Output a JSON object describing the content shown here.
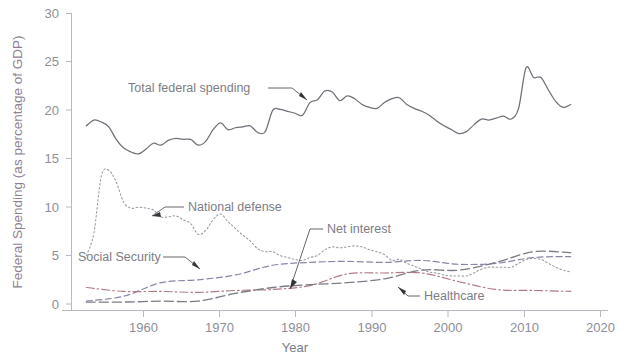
{
  "chart_data": {
    "type": "line",
    "title": "",
    "xlabel": "Year",
    "ylabel": "Federal Spending (as percentage of GDP)",
    "xlim": [
      1948,
      2020
    ],
    "ylim": [
      0,
      30
    ],
    "xticks": [
      1960,
      1970,
      1980,
      1990,
      2000,
      2010,
      2020
    ],
    "yticks": [
      0,
      5,
      10,
      15,
      20,
      25,
      30
    ],
    "grid": false,
    "legend": "inline-annotations",
    "series": [
      {
        "name": "Total federal spending",
        "color": "#6f6f77",
        "style": "solid",
        "x": [
          1950,
          1951,
          1952,
          1953,
          1954,
          1955,
          1956,
          1957,
          1958,
          1959,
          1960,
          1961,
          1962,
          1963,
          1964,
          1965,
          1966,
          1967,
          1968,
          1969,
          1970,
          1971,
          1972,
          1973,
          1974,
          1975,
          1976,
          1977,
          1978,
          1979,
          1980,
          1981,
          1982,
          1983,
          1984,
          1985,
          1986,
          1987,
          1988,
          1989,
          1990,
          1991,
          1992,
          1993,
          1994,
          1995,
          1996,
          1997,
          1998,
          1999,
          2000,
          2001,
          2002,
          2003,
          2004,
          2005,
          2006,
          2007,
          2008,
          2009,
          2010,
          2011,
          2012,
          2013,
          2014,
          2015
        ],
        "values": [
          18.4,
          19.0,
          18.8,
          18.3,
          17.0,
          16.1,
          15.7,
          15.5,
          16.0,
          16.6,
          16.4,
          16.9,
          17.1,
          17.0,
          17.0,
          16.4,
          16.8,
          18.0,
          18.7,
          18.0,
          18.2,
          18.3,
          18.4,
          17.7,
          17.8,
          20.0,
          20.1,
          19.9,
          19.7,
          19.5,
          20.8,
          21.1,
          22.0,
          21.9,
          21.0,
          21.5,
          21.2,
          20.6,
          20.3,
          20.2,
          20.8,
          21.2,
          21.3,
          20.6,
          20.2,
          19.9,
          19.5,
          18.9,
          18.4,
          18.0,
          17.6,
          17.8,
          18.5,
          19.1,
          19.0,
          19.2,
          19.4,
          19.1,
          20.2,
          24.4,
          23.4,
          23.4,
          22.1,
          20.9,
          20.3,
          20.6
        ]
      },
      {
        "name": "National defense",
        "color": "#9b9ba5",
        "style": "dotted",
        "x": [
          1950,
          1951,
          1952,
          1953,
          1954,
          1955,
          1956,
          1957,
          1958,
          1959,
          1960,
          1961,
          1962,
          1963,
          1964,
          1965,
          1966,
          1967,
          1968,
          1969,
          1970,
          1971,
          1972,
          1973,
          1974,
          1975,
          1976,
          1977,
          1978,
          1979,
          1980,
          1981,
          1982,
          1983,
          1984,
          1985,
          1986,
          1987,
          1988,
          1989,
          1990,
          1991,
          1992,
          1993,
          1994,
          1995,
          1996,
          1997,
          1998,
          1999,
          2000,
          2001,
          2002,
          2003,
          2004,
          2005,
          2006,
          2007,
          2008,
          2009,
          2010,
          2011,
          2012,
          2013,
          2014,
          2015
        ],
        "values": [
          5.0,
          7.3,
          13.2,
          13.8,
          12.6,
          10.5,
          9.9,
          10.0,
          9.9,
          9.7,
          9.0,
          9.0,
          9.1,
          8.7,
          8.3,
          7.2,
          7.6,
          8.7,
          9.3,
          8.5,
          7.8,
          7.1,
          6.5,
          5.7,
          5.4,
          5.4,
          5.0,
          4.8,
          4.6,
          4.5,
          4.8,
          5.0,
          5.6,
          5.9,
          5.8,
          5.9,
          6.0,
          5.9,
          5.6,
          5.4,
          5.1,
          4.5,
          4.6,
          4.2,
          3.9,
          3.6,
          3.3,
          3.2,
          3.0,
          2.9,
          2.9,
          2.9,
          3.2,
          3.6,
          3.8,
          3.8,
          3.8,
          3.8,
          4.2,
          4.6,
          4.7,
          4.6,
          4.2,
          3.8,
          3.5,
          3.3
        ]
      },
      {
        "name": "Social Security",
        "color": "#8686a8",
        "style": "dashed",
        "x": [
          1950,
          1955,
          1960,
          1965,
          1970,
          1975,
          1980,
          1985,
          1990,
          1995,
          2000,
          2005,
          2010,
          2015
        ],
        "values": [
          0.3,
          0.8,
          2.2,
          2.5,
          3.0,
          4.0,
          4.3,
          4.4,
          4.3,
          4.5,
          4.1,
          4.2,
          4.8,
          4.9
        ]
      },
      {
        "name": "Net interest",
        "color": "#b07a86",
        "style": "dashdot",
        "x": [
          1950,
          1955,
          1960,
          1965,
          1970,
          1975,
          1980,
          1985,
          1990,
          1995,
          2000,
          2005,
          2010,
          2015
        ],
        "values": [
          1.7,
          1.3,
          1.3,
          1.2,
          1.4,
          1.5,
          1.9,
          3.1,
          3.2,
          3.2,
          2.3,
          1.5,
          1.4,
          1.3
        ]
      },
      {
        "name": "Healthcare",
        "color": "#7c7c86",
        "style": "longdash",
        "x": [
          1950,
          1955,
          1960,
          1965,
          1970,
          1975,
          1980,
          1985,
          1990,
          1995,
          2000,
          2005,
          2010,
          2015
        ],
        "values": [
          0.2,
          0.2,
          0.3,
          0.3,
          1.1,
          1.7,
          2.0,
          2.2,
          2.6,
          3.5,
          3.5,
          4.3,
          5.4,
          5.3
        ]
      }
    ],
    "annotations": [
      {
        "id": "total-federal-spending",
        "text": "Total federal spending"
      },
      {
        "id": "national-defense",
        "text": "National defense"
      },
      {
        "id": "net-interest",
        "text": "Net interest"
      },
      {
        "id": "social-security",
        "text": "Social Security"
      },
      {
        "id": "healthcare",
        "text": "Healthcare"
      }
    ]
  },
  "axis": {
    "y_title": "Federal Spending (as percentage of GDP)",
    "x_title": "Year",
    "yticks": [
      "30",
      "25",
      "20",
      "15",
      "10",
      "5",
      "0"
    ],
    "xticks": [
      "1960",
      "1970",
      "1980",
      "1990",
      "2000",
      "2010",
      "2020"
    ]
  },
  "caption": {
    "text": ""
  }
}
